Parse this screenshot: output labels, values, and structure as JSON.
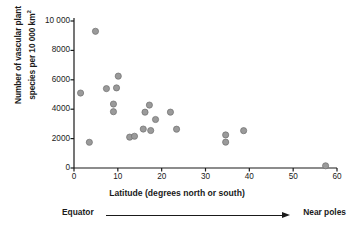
{
  "chart_data": {
    "type": "scatter",
    "title": "",
    "xlabel": "Latitude (degrees north or south)",
    "ylabel_line1": "Number of vascular plant",
    "ylabel_line2": "species per 10 000 km",
    "ylabel_superscript": "2",
    "xlim": [
      0,
      60
    ],
    "ylim": [
      0,
      10000
    ],
    "xticks": [
      "0",
      "10",
      "20",
      "30",
      "40",
      "50",
      "60"
    ],
    "xtick_values": [
      0,
      10,
      20,
      30,
      40,
      50,
      60
    ],
    "yticks": [
      "0",
      "2000",
      "4000",
      "6000",
      "8000",
      "10 000"
    ],
    "ytick_values": [
      0,
      2000,
      4000,
      6000,
      8000,
      10000
    ],
    "grid": false,
    "legend": null,
    "marker_color": "#9a9a9a",
    "marker_edge_color": "#6f6f6f",
    "axis_color": "#1a1a1a",
    "points": [
      {
        "x": 1.5,
        "y": 5100
      },
      {
        "x": 3.5,
        "y": 1750
      },
      {
        "x": 4.9,
        "y": 9300
      },
      {
        "x": 7.4,
        "y": 5400
      },
      {
        "x": 9.0,
        "y": 4350
      },
      {
        "x": 9.0,
        "y": 3830
      },
      {
        "x": 9.7,
        "y": 5450
      },
      {
        "x": 10.1,
        "y": 6250
      },
      {
        "x": 12.7,
        "y": 2100
      },
      {
        "x": 13.8,
        "y": 2160
      },
      {
        "x": 15.8,
        "y": 2650
      },
      {
        "x": 16.2,
        "y": 3800
      },
      {
        "x": 17.2,
        "y": 4280
      },
      {
        "x": 17.5,
        "y": 2550
      },
      {
        "x": 18.6,
        "y": 3300
      },
      {
        "x": 22.0,
        "y": 3800
      },
      {
        "x": 23.4,
        "y": 2640
      },
      {
        "x": 34.6,
        "y": 2250
      },
      {
        "x": 34.6,
        "y": 1760
      },
      {
        "x": 38.7,
        "y": 2540
      },
      {
        "x": 57.4,
        "y": 150
      }
    ],
    "annotation": {
      "left_label": "Equator",
      "right_label": "Near poles",
      "arrow": "left-to-right-arrow"
    }
  }
}
